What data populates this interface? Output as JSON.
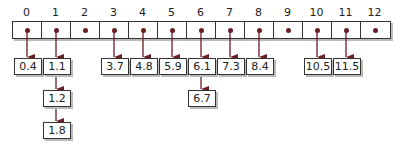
{
  "diagram": {
    "type": "hash-table-chaining",
    "accent_color": "#6b1e24",
    "buckets": [
      {
        "index": "0",
        "chain": [
          "0.4"
        ]
      },
      {
        "index": "1",
        "chain": [
          "1.1",
          "1.2",
          "1.8"
        ]
      },
      {
        "index": "2",
        "chain": []
      },
      {
        "index": "3",
        "chain": [
          "3.7"
        ]
      },
      {
        "index": "4",
        "chain": [
          "4.8"
        ]
      },
      {
        "index": "5",
        "chain": [
          "5.9"
        ]
      },
      {
        "index": "6",
        "chain": [
          "6.1",
          "6.7"
        ]
      },
      {
        "index": "7",
        "chain": [
          "7.3"
        ]
      },
      {
        "index": "8",
        "chain": [
          "8.4"
        ]
      },
      {
        "index": "9",
        "chain": []
      },
      {
        "index": "10",
        "chain": [
          "10.5"
        ]
      },
      {
        "index": "11",
        "chain": [
          "11.5"
        ]
      },
      {
        "index": "12",
        "chain": []
      }
    ]
  }
}
